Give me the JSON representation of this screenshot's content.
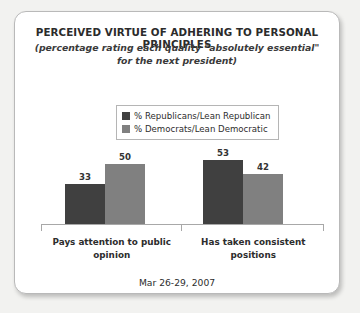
{
  "chart_data": {
    "type": "bar",
    "title": "PERCEIVED VIRTUE OF ADHERING TO PERSONAL PRINCIPLES",
    "subtitle_line1": "(percentage rating each quality \"absolutely essential\"",
    "subtitle_line2": "for the next president)",
    "categories": [
      "Pays attention to public opinion",
      "Has taken consistent positions"
    ],
    "series": [
      {
        "name": "% Republicans/Lean Republican",
        "color": "#404040",
        "values": [
          33,
          53
        ]
      },
      {
        "name": "% Democrats/Lean Democratic",
        "color": "#808080",
        "values": [
          50,
          42
        ]
      }
    ],
    "xlabel": "",
    "ylabel": "",
    "ylim": [
      0,
      60
    ],
    "grid": false,
    "legend_position": "top-center",
    "value_labels": true,
    "footnote": "Mar 26-29, 2007"
  }
}
